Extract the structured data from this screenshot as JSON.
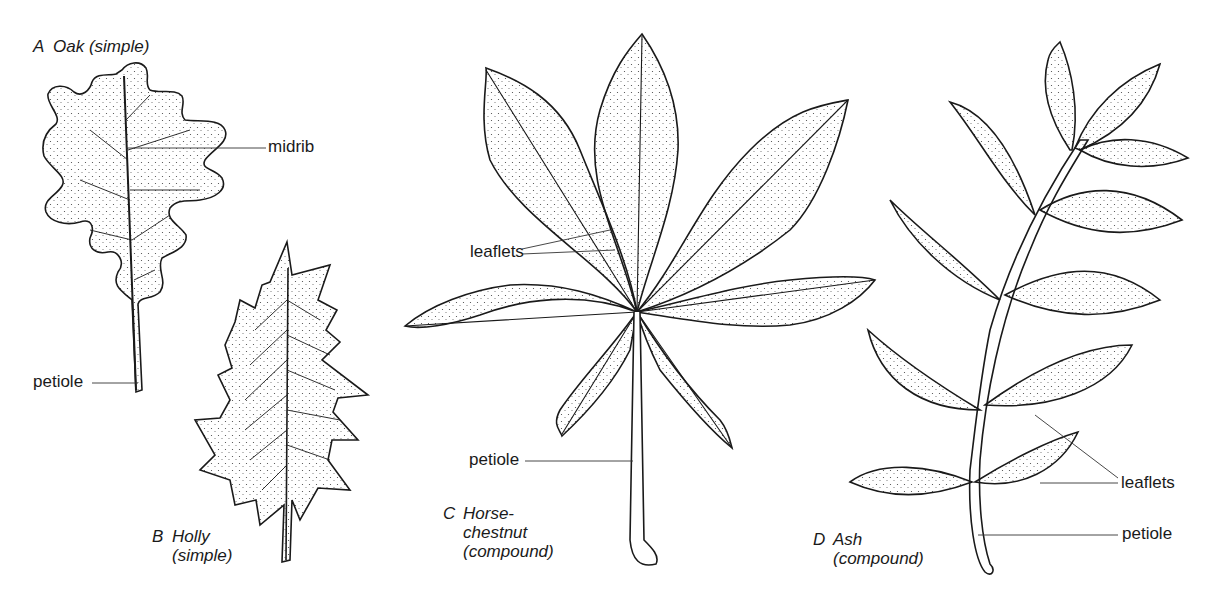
{
  "figure": {
    "panels": [
      {
        "id": "A",
        "letter": "A",
        "name": "Oak (simple)",
        "lines": [
          "Oak (simple)"
        ],
        "type": "simple"
      },
      {
        "id": "B",
        "letter": "B",
        "name": "Holly",
        "lines": [
          "Holly",
          "(simple)"
        ],
        "type": "simple"
      },
      {
        "id": "C",
        "letter": "C",
        "name": "Horse-chestnut",
        "lines": [
          "Horse-",
          "chestnut",
          "(compound)"
        ],
        "type": "compound"
      },
      {
        "id": "D",
        "letter": "D",
        "name": "Ash",
        "lines": [
          "Ash",
          "(compound)"
        ],
        "type": "compound"
      }
    ],
    "labels": {
      "oak_midrib": "midrib",
      "oak_petiole": "petiole",
      "horsechestnut_leaflets": "leaflets",
      "horsechestnut_petiole": "petiole",
      "ash_leaflets": "leaflets",
      "ash_petiole": "petiole"
    },
    "colors": {
      "ink": "#1a1a1a",
      "background": "#ffffff",
      "stipple": "#3a3a3a"
    }
  }
}
